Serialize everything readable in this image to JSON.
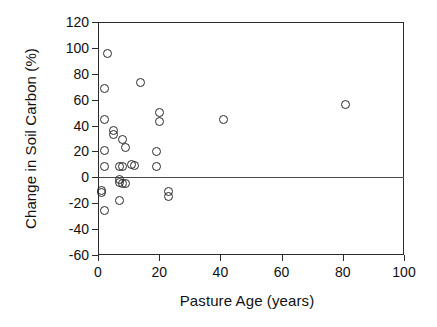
{
  "chart_data": {
    "type": "scatter",
    "title": "",
    "xlabel": "Pasture Age (years)",
    "ylabel": "Change in Soil Carbon (%)",
    "xlim": [
      0,
      100
    ],
    "ylim": [
      -60,
      120
    ],
    "xticks": [
      0,
      20,
      40,
      60,
      80,
      100
    ],
    "yticks": [
      -60,
      -40,
      -20,
      0,
      20,
      40,
      60,
      80,
      100,
      120
    ],
    "xtick_labels": [
      "0",
      "20",
      "40",
      "60",
      "80",
      "100"
    ],
    "ytick_labels": [
      "120",
      "100",
      "80",
      "60",
      "40",
      "20",
      "0",
      "-20",
      "-40",
      "-60"
    ],
    "grid": false,
    "legend": null,
    "marker_style": "open-circle",
    "reference_lines": [
      {
        "axis": "y",
        "value": 0,
        "color": "#4a4a4a"
      }
    ],
    "series": [
      {
        "name": "Change in Soil Carbon",
        "points": [
          {
            "x": 3,
            "y": 96
          },
          {
            "x": 2,
            "y": 69
          },
          {
            "x": 14,
            "y": 73
          },
          {
            "x": 81,
            "y": 56
          },
          {
            "x": 20,
            "y": 50
          },
          {
            "x": 41,
            "y": 45
          },
          {
            "x": 2,
            "y": 45
          },
          {
            "x": 20,
            "y": 43
          },
          {
            "x": 5,
            "y": 36
          },
          {
            "x": 5,
            "y": 33
          },
          {
            "x": 8,
            "y": 29
          },
          {
            "x": 9,
            "y": 23
          },
          {
            "x": 2,
            "y": 21
          },
          {
            "x": 19,
            "y": 20
          },
          {
            "x": 11,
            "y": 10
          },
          {
            "x": 12,
            "y": 9
          },
          {
            "x": 2,
            "y": 8
          },
          {
            "x": 7,
            "y": 8
          },
          {
            "x": 8,
            "y": 8
          },
          {
            "x": 19,
            "y": 8
          },
          {
            "x": 7,
            "y": -2
          },
          {
            "x": 7,
            "y": -4
          },
          {
            "x": 8,
            "y": -5
          },
          {
            "x": 9,
            "y": -5
          },
          {
            "x": 1,
            "y": -10
          },
          {
            "x": 1,
            "y": -12
          },
          {
            "x": 23,
            "y": -11
          },
          {
            "x": 23,
            "y": -15
          },
          {
            "x": 7,
            "y": -18
          },
          {
            "x": 2,
            "y": -26
          }
        ]
      }
    ]
  }
}
